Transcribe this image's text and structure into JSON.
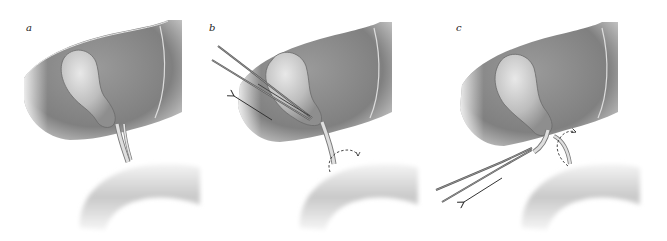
{
  "figure": {
    "panels": [
      {
        "label": "a",
        "description": "Liver with gallbladder and cystic duct above duodenum"
      },
      {
        "label": "b",
        "description": "Forceps grasping gallbladder neck with traction arrow; dashed rotation arrow at duct"
      },
      {
        "label": "c",
        "description": "Forceps pulling cystic duct downward with arrow; dashed rotation arrow at duct"
      }
    ]
  },
  "colors": {
    "liver": "#8a8a8a",
    "liver_dark": "#6e6e6e",
    "liver_edge": "#d8d8d8",
    "gallbladder": "#c4c4c4",
    "duct": "#d2d2d2",
    "duodenum": "#dadada",
    "instrument": "#555555",
    "arrow": "#333333"
  }
}
